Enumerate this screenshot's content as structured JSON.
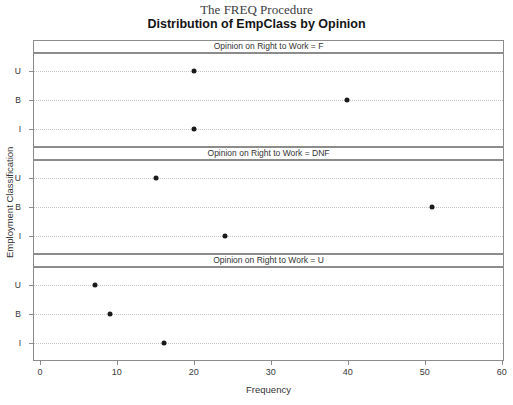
{
  "titles": {
    "procedure": "The FREQ Procedure",
    "main": "Distribution of EmpClass by Opinion"
  },
  "chart_data": {
    "type": "scatter",
    "title": "Distribution of EmpClass by Opinion",
    "subtitle": "The FREQ Procedure",
    "xlabel": "Frequency",
    "ylabel": "Employment Classification",
    "x_ticks": [
      0,
      10,
      20,
      30,
      40,
      50,
      60
    ],
    "xlim": [
      -0.9,
      60.3
    ],
    "grid": "horizontal-dotted",
    "legend": "none",
    "y_categories": [
      "U",
      "B",
      "I"
    ],
    "row_positions_pct": [
      19,
      50,
      81
    ],
    "panels": [
      {
        "label": "Opinion on Right to Work = F",
        "points": {
          "U": 20,
          "B": 40,
          "I": 20
        }
      },
      {
        "label": "Opinion on Right to Work = DNF",
        "points": {
          "U": 15,
          "B": 51,
          "I": 24
        }
      },
      {
        "label": "Opinion on Right to Work = U",
        "points": {
          "U": 7,
          "B": 9,
          "I": 16
        }
      }
    ],
    "colors": {
      "point": "#1a1a1a",
      "panel_border": "#8c8c8c",
      "gridline": "#c6c6c6",
      "text": "#333333",
      "background": "#ffffff"
    }
  }
}
